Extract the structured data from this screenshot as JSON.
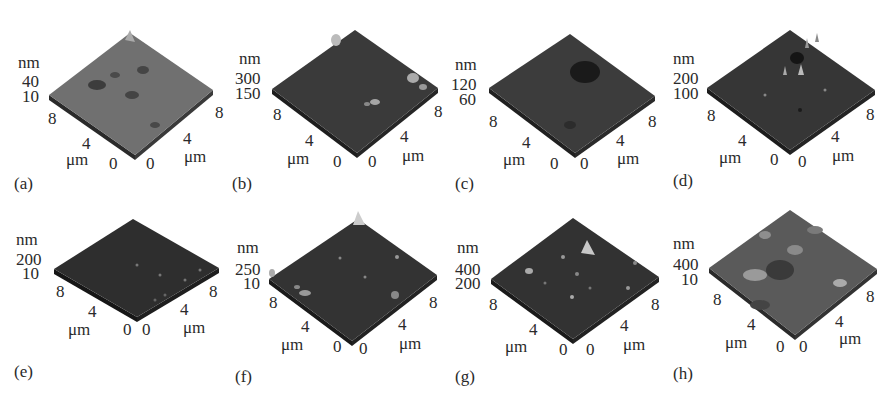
{
  "figure": {
    "panels": [
      {
        "id": "a",
        "caption": "(a)",
        "z_unit": "nm",
        "z_ticks": [
          "40",
          "10"
        ],
        "x_ticks": [
          "8",
          "4",
          "0"
        ],
        "y_ticks": [
          "0",
          "4",
          "8"
        ],
        "x_unit": "μm",
        "y_unit": "μm",
        "tone": "#6e6e6e",
        "edge": "#3a3a3a"
      },
      {
        "id": "b",
        "caption": "(b)",
        "z_unit": "nm",
        "z_ticks": [
          "300",
          "150"
        ],
        "x_ticks": [
          "8",
          "4",
          "0"
        ],
        "y_ticks": [
          "0",
          "4",
          "8"
        ],
        "x_unit": "μm",
        "y_unit": "μm",
        "tone": "#3a3a3a",
        "edge": "#1e1e1e"
      },
      {
        "id": "c",
        "caption": "(c)",
        "z_unit": "nm",
        "z_ticks": [
          "120",
          "60"
        ],
        "x_ticks": [
          "8",
          "4",
          "0"
        ],
        "y_ticks": [
          "0",
          "4",
          "8"
        ],
        "x_unit": "μm",
        "y_unit": "μm",
        "tone": "#3c3c3c",
        "edge": "#222222"
      },
      {
        "id": "d",
        "caption": "(d)",
        "z_unit": "nm",
        "z_ticks": [
          "200",
          "100"
        ],
        "x_ticks": [
          "8",
          "4",
          "0"
        ],
        "y_ticks": [
          "0",
          "4",
          "8"
        ],
        "x_unit": "μm",
        "y_unit": "μm",
        "tone": "#363636",
        "edge": "#1c1c1c"
      },
      {
        "id": "e",
        "caption": "(e)",
        "z_unit": "nm",
        "z_ticks": [
          "200",
          "10"
        ],
        "x_ticks": [
          "8",
          "4",
          "0"
        ],
        "y_ticks": [
          "0",
          "4",
          "8"
        ],
        "x_unit": "μm",
        "y_unit": "μm",
        "tone": "#2e2e2e",
        "edge": "#181818"
      },
      {
        "id": "f",
        "caption": "(f)",
        "z_unit": "nm",
        "z_ticks": [
          "250",
          "10"
        ],
        "x_ticks": [
          "8",
          "4",
          "0"
        ],
        "y_ticks": [
          "0",
          "4",
          "8"
        ],
        "x_unit": "μm",
        "y_unit": "μm",
        "tone": "#333333",
        "edge": "#1a1a1a"
      },
      {
        "id": "g",
        "caption": "(g)",
        "z_unit": "nm",
        "z_ticks": [
          "400",
          "200"
        ],
        "x_ticks": [
          "8",
          "4",
          "0"
        ],
        "y_ticks": [
          "0",
          "4",
          "8"
        ],
        "x_unit": "μm",
        "y_unit": "μm",
        "tone": "#323232",
        "edge": "#1a1a1a"
      },
      {
        "id": "h",
        "caption": "(h)",
        "z_unit": "nm",
        "z_ticks": [
          "400",
          "10"
        ],
        "x_ticks": [
          "8",
          "4",
          "0"
        ],
        "y_ticks": [
          "0",
          "4",
          "8"
        ],
        "x_unit": "μm",
        "y_unit": "μm",
        "tone": "#5a5a5a",
        "edge": "#2a2a2a"
      }
    ]
  }
}
